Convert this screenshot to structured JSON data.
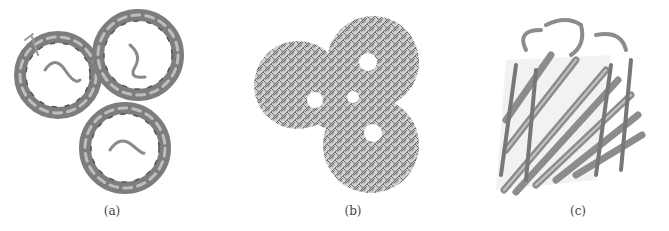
{
  "figure": {
    "panels": [
      {
        "label": "(a)",
        "description": "Trimeric porin top view, ribbon cartoon"
      },
      {
        "label": "(b)",
        "description": "Trimeric porin top view, stick/wireframe model"
      },
      {
        "label": "(c)",
        "description": "Single beta-barrel monomer side view, ribbon cartoon"
      }
    ]
  }
}
